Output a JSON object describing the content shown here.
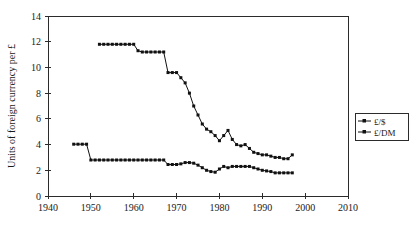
{
  "chart_data": {
    "type": "line",
    "title": "",
    "subtitle": "",
    "xlabel": "",
    "ylabel": "Units of foreign currency per £",
    "xlim": [
      1940,
      2010
    ],
    "ylim": [
      0,
      14
    ],
    "xticks": [
      1940,
      1950,
      1960,
      1970,
      1980,
      1990,
      2000,
      2010
    ],
    "xtick_labels": [
      "1940",
      "1950",
      "1960",
      "1970",
      "1980",
      "1990",
      "2000",
      "2010"
    ],
    "yticks": [
      0,
      2,
      4,
      6,
      8,
      10,
      12,
      14
    ],
    "ytick_labels": [
      "0",
      "2",
      "4",
      "6",
      "8",
      "10",
      "12",
      "14"
    ],
    "grid": false,
    "legend_position": "right",
    "marker": "square",
    "series": [
      {
        "name": "£/$",
        "color": "#111111",
        "x": [
          1952,
          1953,
          1954,
          1955,
          1956,
          1957,
          1958,
          1959,
          1960,
          1961,
          1962,
          1963,
          1964,
          1965,
          1966,
          1967,
          1968,
          1969,
          1970,
          1971,
          1972,
          1973,
          1974,
          1975,
          1976,
          1977,
          1978,
          1979,
          1980,
          1981,
          1982,
          1983,
          1984,
          1985,
          1986,
          1987,
          1988,
          1989,
          1990,
          1991,
          1992,
          1993,
          1994,
          1995,
          1996,
          1997
        ],
        "y": [
          11.8,
          11.8,
          11.8,
          11.8,
          11.8,
          11.8,
          11.8,
          11.8,
          11.8,
          11.3,
          11.2,
          11.2,
          11.2,
          11.2,
          11.2,
          11.2,
          9.6,
          9.6,
          9.6,
          9.2,
          8.8,
          8.0,
          7.0,
          6.3,
          5.6,
          5.2,
          5.0,
          4.7,
          4.3,
          4.7,
          5.1,
          4.4,
          4.0,
          3.9,
          4.0,
          3.7,
          3.4,
          3.3,
          3.2,
          3.2,
          3.1,
          3.0,
          3.0,
          2.9,
          2.9,
          3.2
        ]
      },
      {
        "name": "£/DM",
        "color": "#111111",
        "x": [
          1946,
          1947,
          1948,
          1949,
          1950,
          1951,
          1952,
          1953,
          1954,
          1955,
          1956,
          1957,
          1958,
          1959,
          1960,
          1961,
          1962,
          1963,
          1964,
          1965,
          1966,
          1967,
          1968,
          1969,
          1970,
          1971,
          1972,
          1973,
          1974,
          1975,
          1976,
          1977,
          1978,
          1979,
          1980,
          1981,
          1982,
          1983,
          1984,
          1985,
          1986,
          1987,
          1988,
          1989,
          1990,
          1991,
          1992,
          1993,
          1994,
          1995,
          1996,
          1997
        ],
        "y": [
          4.03,
          4.03,
          4.03,
          4.03,
          2.8,
          2.8,
          2.8,
          2.8,
          2.8,
          2.8,
          2.8,
          2.8,
          2.8,
          2.8,
          2.8,
          2.8,
          2.8,
          2.8,
          2.8,
          2.8,
          2.8,
          2.8,
          2.45,
          2.45,
          2.45,
          2.5,
          2.6,
          2.6,
          2.55,
          2.4,
          2.2,
          2.0,
          1.9,
          1.85,
          2.1,
          2.3,
          2.2,
          2.3,
          2.3,
          2.3,
          2.3,
          2.3,
          2.2,
          2.1,
          2.0,
          1.95,
          1.9,
          1.8,
          1.8,
          1.8,
          1.8,
          1.8
        ]
      }
    ],
    "legend": [
      "£/$",
      "£/DM"
    ]
  },
  "legend": {
    "items": [
      {
        "label": "£/$"
      },
      {
        "label": "£/DM"
      }
    ]
  }
}
